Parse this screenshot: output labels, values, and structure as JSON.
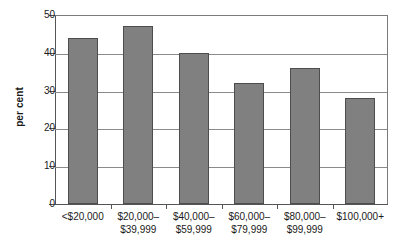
{
  "chart_data": {
    "type": "bar",
    "title": "",
    "subtitle": "",
    "xlabel": "",
    "ylabel": "per cent",
    "categories": [
      "<$20,000",
      "$20,000–\n$39,999",
      "$40,000–\n$59,999",
      "$60,000–\n$79,999",
      "$80,000–\n$99,999",
      "$100,000+"
    ],
    "values": [
      44,
      47,
      40,
      32,
      36,
      28
    ],
    "ylim": [
      0,
      50
    ],
    "yticks": [
      0,
      10,
      20,
      30,
      40,
      50
    ],
    "ytick_labels": [
      "0",
      "10",
      "20",
      "30",
      "40",
      "50"
    ],
    "grid": "horizontal",
    "legend": "none",
    "bar_color": "#808080",
    "bar_border_color": "#4d4d4d",
    "gridline_color": "#8a8a8a",
    "axis_color": "#555555",
    "background_color": "#ffffff"
  }
}
